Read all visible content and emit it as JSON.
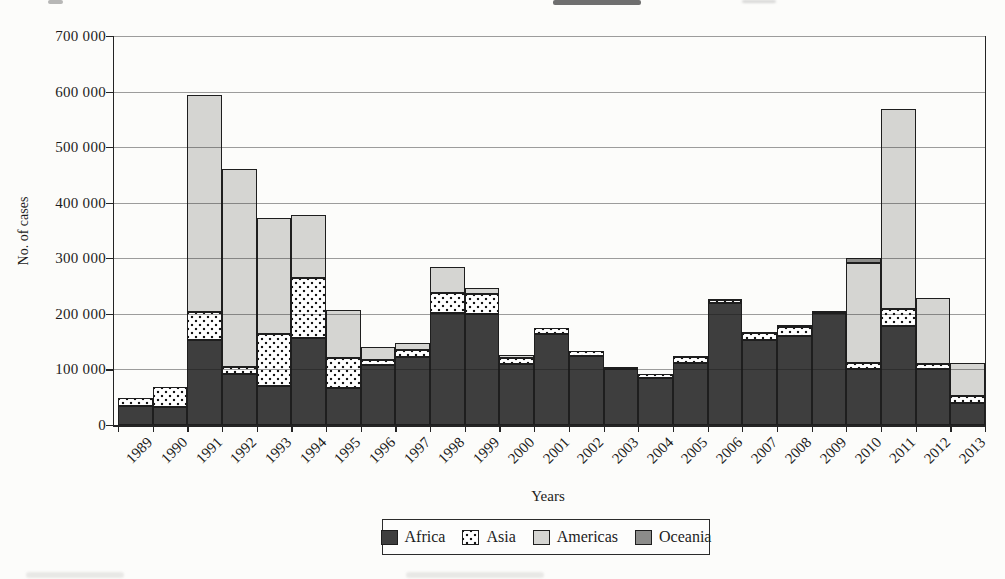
{
  "chart_data": {
    "type": "bar",
    "stacked": true,
    "title": "",
    "xlabel": "Years",
    "ylabel": "No. of cases",
    "ylim": [
      0,
      700000
    ],
    "ytick_step": 100000,
    "ytick_labels": [
      "0",
      "100 000",
      "200 000",
      "300 000",
      "400 000",
      "500 000",
      "600 000",
      "700 000"
    ],
    "grid": true,
    "legend_position": "bottom",
    "categories": [
      "1989",
      "1990",
      "1991",
      "1992",
      "1993",
      "1994",
      "1995",
      "1996",
      "1997",
      "1998",
      "1999",
      "2000",
      "2001",
      "2002",
      "2003",
      "2004",
      "2005",
      "2006",
      "2007",
      "2008",
      "2009",
      "2010",
      "2011",
      "2012",
      "2013"
    ],
    "series": [
      {
        "name": "Africa",
        "pattern": "solid",
        "color": "#3e3e3e",
        "values": [
          35000,
          33000,
          153000,
          91000,
          70000,
          157000,
          66000,
          108000,
          122000,
          201000,
          200000,
          110000,
          164000,
          124000,
          100000,
          85000,
          112000,
          220000,
          153000,
          161000,
          201000,
          101000,
          178000,
          101000,
          40000
        ]
      },
      {
        "name": "Asia",
        "pattern": "dots",
        "color": "#ffffff",
        "values": [
          13000,
          35000,
          50000,
          14000,
          94000,
          108000,
          54000,
          9000,
          13000,
          36000,
          36000,
          11000,
          11000,
          10000,
          4000,
          6000,
          11000,
          5000,
          12000,
          15000,
          4000,
          11000,
          31000,
          9000,
          13000
        ]
      },
      {
        "name": "Americas",
        "pattern": "solid",
        "color": "#d5d5d2",
        "values": [
          0,
          0,
          390000,
          355000,
          208000,
          112000,
          87000,
          23000,
          12000,
          47000,
          11000,
          5000,
          1000,
          1000,
          0,
          0,
          2000,
          2000,
          3000,
          4000,
          1000,
          179000,
          360000,
          119000,
          59000
        ]
      },
      {
        "name": "Oceania",
        "pattern": "solid",
        "color": "#8c8c8a",
        "values": [
          0,
          0,
          0,
          0,
          0,
          0,
          0,
          0,
          0,
          0,
          0,
          0,
          0,
          0,
          0,
          0,
          0,
          0,
          0,
          0,
          0,
          9000,
          0,
          0,
          0
        ]
      }
    ]
  }
}
